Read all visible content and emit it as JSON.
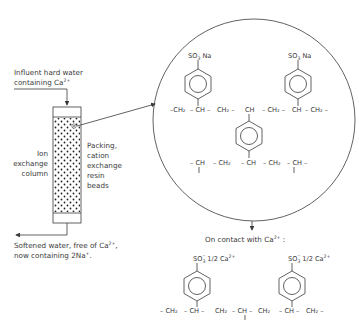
{
  "diagram": {
    "labels": {
      "influent_line1": "Influent hard water",
      "influent_line2": "containing Ca",
      "influent_charge": "2+",
      "column_line1": "Ion",
      "column_line2": "exchange",
      "column_line3": "column",
      "packing_line1": "Packing,",
      "packing_line2": "cation",
      "packing_line3": "exchange",
      "packing_line4": "resin",
      "packing_line5": "beads",
      "effluent_line1": "Softened water, free of Ca",
      "effluent_charge": "2+",
      "effluent_line1_end": ",",
      "effluent_line2": "now containing 2Na",
      "effluent_line2_charge": "+",
      "effluent_line2_end": ".",
      "contact_text": "On contact with Ca",
      "contact_charge": "2+",
      "contact_end": " :"
    },
    "resin_structure": {
      "substituent": "SO",
      "substituent_sub": "3",
      "counter_ion": " Na",
      "chain_top": [
        "–CH₂",
        "– CH –",
        "CH₂ –",
        "CH",
        "– CH₂ –",
        "CH",
        "– CH₂ –"
      ],
      "chain_bottom": [
        "– CH",
        "– CH₂",
        "– CH",
        "– CH₂",
        "– CH –"
      ]
    },
    "calcium_form": {
      "substituent": "SO",
      "substituent_sub": "3",
      "substituent_charge": "–",
      "counter_ion": " 1/2 Ca",
      "counter_charge": "2+",
      "chain": [
        "– CH₂",
        "– CH –",
        "CH₂",
        "– CH –",
        "CH₂",
        "– CH –",
        "CH₂ –"
      ]
    }
  }
}
